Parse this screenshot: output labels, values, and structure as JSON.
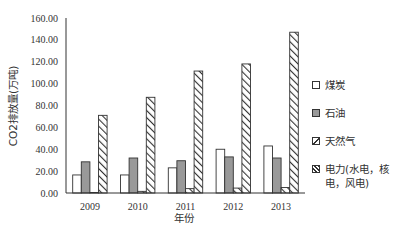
{
  "chart_data": {
    "type": "bar",
    "title": "",
    "xlabel": "年份",
    "ylabel": "CO2排放量(万吨)",
    "ylim": [
      0,
      160
    ],
    "yticks": [
      "0.00",
      "20.00",
      "40.00",
      "60.00",
      "80.00",
      "100.00",
      "120.00",
      "140.00",
      "160.00"
    ],
    "categories": [
      "2009",
      "2010",
      "2011",
      "2012",
      "2013"
    ],
    "grid": false,
    "legend_position": "right",
    "series": [
      {
        "name": "煤炭",
        "style": "white",
        "values": [
          16.5,
          16.5,
          23,
          40,
          43
        ]
      },
      {
        "name": "石油",
        "style": "gray",
        "values": [
          28.5,
          32,
          29.5,
          33,
          32
        ]
      },
      {
        "name": "天然气",
        "style": "hatch-light",
        "values": [
          0.5,
          1.5,
          4,
          4.5,
          5
        ]
      },
      {
        "name": "电力(水电，核电，风电)",
        "style": "hatch",
        "values": [
          71,
          87.5,
          111.5,
          118,
          147
        ]
      }
    ]
  },
  "legend": {
    "items": [
      {
        "label": "煤炭"
      },
      {
        "label": "石油"
      },
      {
        "label": "天然气"
      },
      {
        "label": "电力(水电，核电，风电)"
      }
    ]
  },
  "colors": {
    "axis": "#333333",
    "coal_fill": "#ffffff",
    "oil_fill": "#999999",
    "bar_stroke": "#333333"
  }
}
